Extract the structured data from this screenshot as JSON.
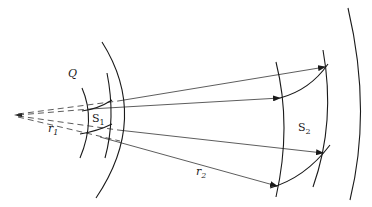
{
  "diagram": {
    "labels": {
      "Q": "Q",
      "S1": "S",
      "S1_sub": "1",
      "S2": "S",
      "S2_sub": "2",
      "r1": "r",
      "r1_sub": "1",
      "r2": "r",
      "r2_sub": "2"
    },
    "colors": {
      "stroke": "#1a1a1a",
      "background": "#ffffff"
    },
    "elements": [
      "point source apex",
      "dashed rays from apex through S1",
      "solid arrows from S1 to S2",
      "inner wavefront arcs around S1",
      "outer wavefront arcs around S2",
      "surface patch S1",
      "surface patch S2"
    ]
  }
}
